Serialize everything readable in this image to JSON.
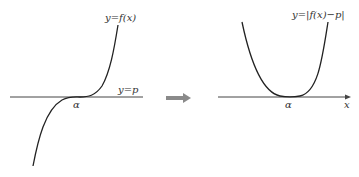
{
  "left_graph": {
    "curve_label": "y=f(x)",
    "line_label": "y=p",
    "point_label": "α"
  },
  "arrow": {
    "meaning": "transforms-to",
    "color": "#8a8a8a"
  },
  "right_graph": {
    "curve_label": "y=|f(x)−p|",
    "point_label": "α",
    "axis_label": "x"
  },
  "colors": {
    "curve": "#222222",
    "axis": "#444444"
  }
}
